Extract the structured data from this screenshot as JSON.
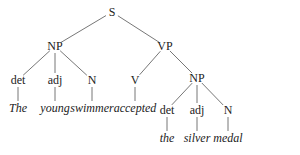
{
  "tree": {
    "nodes": [
      {
        "id": "S",
        "label": "S",
        "x": 112,
        "y": 12,
        "type": "category"
      },
      {
        "id": "NP1",
        "label": "NP",
        "x": 55,
        "y": 46,
        "type": "category"
      },
      {
        "id": "VP",
        "label": "VP",
        "x": 165,
        "y": 46,
        "type": "category"
      },
      {
        "id": "det1",
        "label": "det",
        "x": 18,
        "y": 80,
        "type": "category"
      },
      {
        "id": "adj1",
        "label": "adj",
        "x": 55,
        "y": 80,
        "type": "category"
      },
      {
        "id": "N1",
        "label": "N",
        "x": 92,
        "y": 80,
        "type": "category"
      },
      {
        "id": "V",
        "label": "V",
        "x": 135,
        "y": 80,
        "type": "category"
      },
      {
        "id": "NP2",
        "label": "NP",
        "x": 197,
        "y": 78,
        "type": "category"
      },
      {
        "id": "w_the1",
        "label": "The",
        "x": 18,
        "y": 108,
        "type": "word"
      },
      {
        "id": "w_young",
        "label": "young",
        "x": 55,
        "y": 108,
        "type": "word"
      },
      {
        "id": "w_swimmer",
        "label": "swimmer",
        "x": 92,
        "y": 108,
        "type": "word"
      },
      {
        "id": "w_accepted",
        "label": "accepted",
        "x": 135,
        "y": 108,
        "type": "word"
      },
      {
        "id": "det2",
        "label": "det",
        "x": 167,
        "y": 110,
        "type": "category"
      },
      {
        "id": "adj2",
        "label": "adj",
        "x": 197,
        "y": 110,
        "type": "category"
      },
      {
        "id": "N2",
        "label": "N",
        "x": 228,
        "y": 110,
        "type": "category"
      },
      {
        "id": "w_the2",
        "label": "the",
        "x": 167,
        "y": 138,
        "type": "word"
      },
      {
        "id": "w_silver",
        "label": "silver",
        "x": 197,
        "y": 138,
        "type": "word"
      },
      {
        "id": "w_medal",
        "label": "medal",
        "x": 228,
        "y": 138,
        "type": "word"
      }
    ],
    "edges": [
      [
        "S",
        "NP1"
      ],
      [
        "S",
        "VP"
      ],
      [
        "NP1",
        "det1"
      ],
      [
        "NP1",
        "adj1"
      ],
      [
        "NP1",
        "N1"
      ],
      [
        "VP",
        "V"
      ],
      [
        "VP",
        "NP2"
      ],
      [
        "det1",
        "w_the1"
      ],
      [
        "adj1",
        "w_young"
      ],
      [
        "N1",
        "w_swimmer"
      ],
      [
        "V",
        "w_accepted"
      ],
      [
        "NP2",
        "det2"
      ],
      [
        "NP2",
        "adj2"
      ],
      [
        "NP2",
        "N2"
      ],
      [
        "det2",
        "w_the2"
      ],
      [
        "adj2",
        "w_silver"
      ],
      [
        "N2",
        "w_medal"
      ]
    ],
    "line_color": "#777777"
  }
}
